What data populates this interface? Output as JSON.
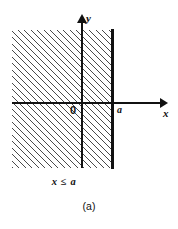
{
  "figure": {
    "caption": "(a)",
    "inequality_label": "x ≤ a",
    "axes": {
      "x_axis_label": "x",
      "y_axis_label": "y",
      "origin_label": "0",
      "boundary_tick_label": "a"
    },
    "colors": {
      "ink": "#111111",
      "hatch": "#4a4a4a",
      "background": "#ffffff"
    }
  },
  "chart_data": {
    "type": "area",
    "title": "(a)",
    "annotations": [
      "x ≤ a"
    ],
    "xlabel": "x",
    "ylabel": "y",
    "tick_labels": {
      "x": [
        "0",
        "a"
      ],
      "y": []
    },
    "grid": false,
    "legend": "none",
    "region": {
      "description": "Shaded (hatched) half-plane of all points with x less than or equal to a",
      "inequality": "x <= a",
      "boundary_x": "a",
      "boundary_style": "solid",
      "boundary_included": true,
      "shading": "diagonal-hatch",
      "shaded_side": "left"
    }
  }
}
